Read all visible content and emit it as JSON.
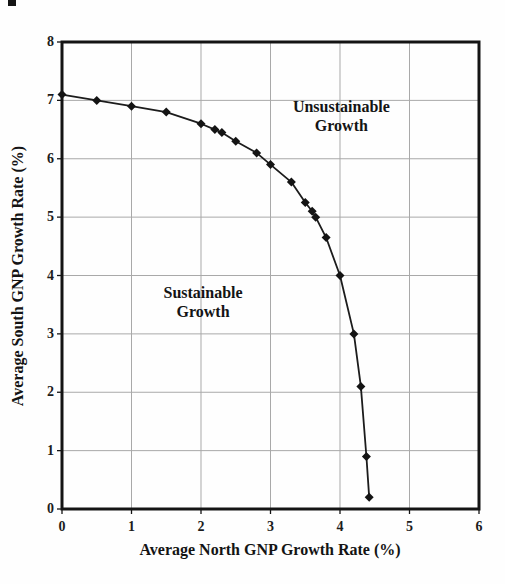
{
  "figure": {
    "background": "#fefefe",
    "border_color": "#141414",
    "grid_color": "#a9a9a9",
    "curve_color": "#1c1c1c",
    "marker_color": "#141414"
  },
  "chart_data": {
    "type": "line",
    "title": "",
    "xlabel": "Average North GNP Growth Rate (%)",
    "ylabel": "Average South GNP Growth Rate (%)",
    "xlim": [
      0,
      6
    ],
    "ylim": [
      0,
      8
    ],
    "x_ticks": [
      0,
      1,
      2,
      3,
      4,
      5,
      6
    ],
    "y_ticks": [
      0,
      1,
      2,
      3,
      4,
      5,
      6,
      7,
      8
    ],
    "grid": true,
    "legend": "none",
    "marker": "diamond",
    "series": [
      {
        "points": [
          [
            0,
            7.1
          ],
          [
            0.5,
            7.0
          ],
          [
            1.0,
            6.9
          ],
          [
            1.5,
            6.8
          ],
          [
            2.0,
            6.6
          ],
          [
            2.2,
            6.5
          ],
          [
            2.3,
            6.45
          ],
          [
            2.5,
            6.3
          ],
          [
            2.8,
            6.1
          ],
          [
            3.0,
            5.9
          ],
          [
            3.3,
            5.6
          ],
          [
            3.5,
            5.25
          ],
          [
            3.6,
            5.1
          ],
          [
            3.65,
            5.0
          ],
          [
            3.8,
            4.65
          ],
          [
            4.0,
            4.0
          ],
          [
            4.2,
            3.0
          ],
          [
            4.3,
            2.1
          ],
          [
            4.38,
            0.9
          ],
          [
            4.42,
            0.2
          ]
        ]
      }
    ],
    "annotations": [
      {
        "lines": [
          "Unsustainable",
          "Growth"
        ],
        "x": 4.02,
        "y": 6.73
      },
      {
        "lines": [
          "Sustainable",
          "Growth"
        ],
        "x": 2.03,
        "y": 3.55
      }
    ]
  }
}
